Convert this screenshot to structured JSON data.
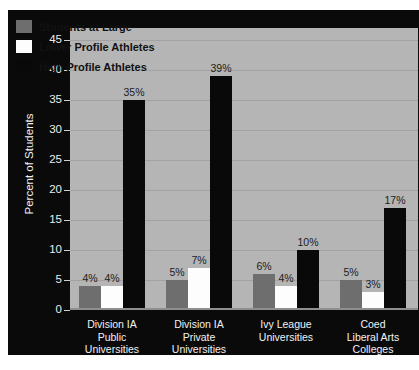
{
  "chart_data": {
    "type": "bar",
    "title": "",
    "xlabel": "",
    "ylabel": "Percent of Students",
    "ylim": [
      0,
      47
    ],
    "yticks": [
      0,
      5,
      10,
      15,
      20,
      25,
      30,
      35,
      40,
      45
    ],
    "ytick_labels": [
      "0",
      "5",
      "10",
      "15",
      "20",
      "25",
      "30",
      "35",
      "40",
      "45"
    ],
    "grid": true,
    "legend_position": "top-left",
    "categories": [
      "Division IA\nPublic\nUniversities",
      "Division IA\nPrivate\nUniversities",
      "Ivy League\nUniversities",
      "Coed\nLiberal Arts\nColleges"
    ],
    "category_lines": [
      [
        "Division IA",
        "Public",
        "Universities"
      ],
      [
        "Division IA",
        "Private",
        "Universities"
      ],
      [
        "Ivy League",
        "Universities"
      ],
      [
        "Coed",
        "Liberal Arts",
        "Colleges"
      ]
    ],
    "series": [
      {
        "name": "Students at Large",
        "color": "#6e6e6e",
        "values": [
          4,
          5,
          6,
          5
        ],
        "data_labels": [
          "4%",
          "5%",
          "6%",
          "5%"
        ]
      },
      {
        "name": "Lower Profile Athletes",
        "color": "#fdfdfd",
        "values": [
          4,
          7,
          4,
          3
        ],
        "data_labels": [
          "4%",
          "7%",
          "4%",
          "3%"
        ]
      },
      {
        "name": "High Profile Athletes",
        "color": "#090909",
        "values": [
          35,
          39,
          10,
          17
        ],
        "data_labels": [
          "35%",
          "39%",
          "10%",
          "17%"
        ]
      }
    ]
  },
  "legend": {
    "items": [
      {
        "label": "Students at Large",
        "swatch": "s0"
      },
      {
        "label": "Lower Profile Athletes",
        "swatch": "s1"
      },
      {
        "label": "High Profile Athletes",
        "swatch": "s2"
      }
    ]
  },
  "colors": {
    "page_background": "#ffffff",
    "panel_background": "#0a0a0a",
    "plot_background": "#b5b5b5",
    "gridline": "#a2a2a2",
    "axis_text": "#ededed",
    "data_label_text": "#1c1c1c"
  }
}
